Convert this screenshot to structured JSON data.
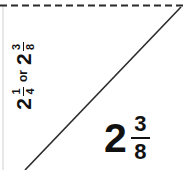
{
  "figure": {
    "background_color": "#ffffff",
    "line_color": "#2b2b2b",
    "text_color": "#111111"
  },
  "axis_label": {
    "first_value": {
      "whole": "2",
      "numerator": "1",
      "denominator": "4"
    },
    "conjunction": "or",
    "second_value": {
      "whole": "2",
      "numerator": "3",
      "denominator": "8"
    }
  },
  "value_label": {
    "whole": "2",
    "numerator": "3",
    "denominator": "8"
  }
}
